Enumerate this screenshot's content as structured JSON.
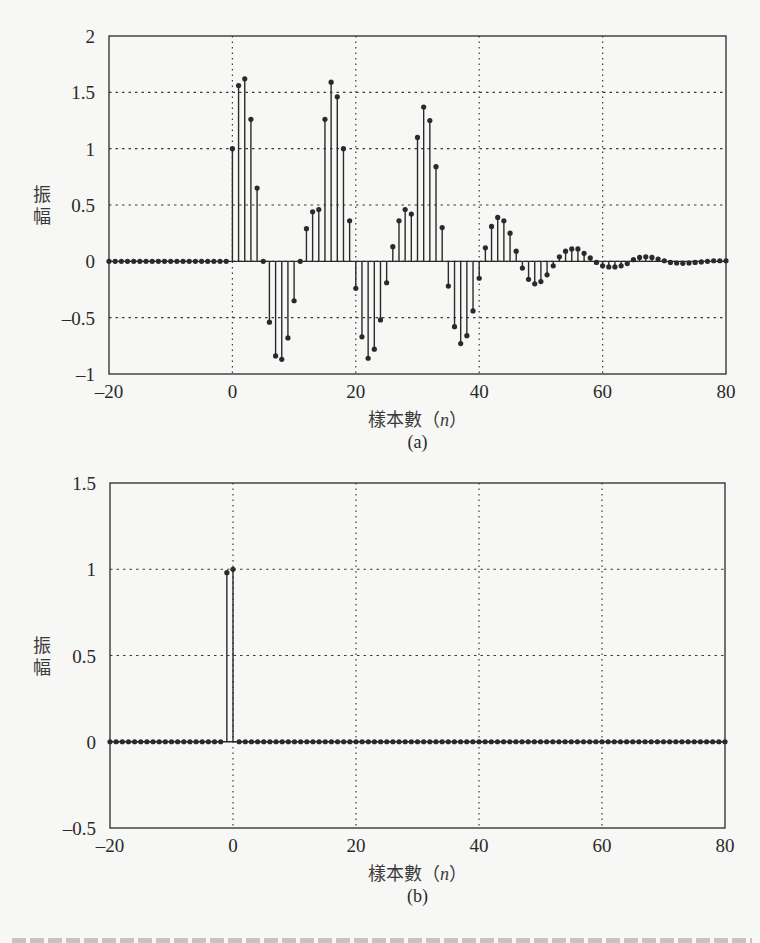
{
  "chart_data": [
    {
      "id": "a",
      "type": "stem",
      "subplot_label": "(a)",
      "xlabel": "樣本數（n）",
      "xlabel_prefix": "樣本數（",
      "xlabel_var": "n",
      "xlabel_suffix": "）",
      "ylabel": "振幅",
      "xlim": [
        -20,
        80
      ],
      "ylim": [
        -1,
        2
      ],
      "xticks": [
        -20,
        0,
        20,
        40,
        60,
        80
      ],
      "xtick_labels": [
        "–20",
        "0",
        "20",
        "40",
        "60",
        "80"
      ],
      "yticks": [
        -1,
        -0.5,
        0,
        0.5,
        1,
        1.5,
        2
      ],
      "ytick_labels": [
        "–1",
        "–0.5",
        "0",
        "0.5",
        "1",
        "1.5",
        "2"
      ],
      "grid": true,
      "frame": {
        "left": 109,
        "top": 36,
        "right": 726,
        "bottom": 374
      },
      "x_start": -20,
      "values": [
        0,
        0,
        0,
        0,
        0,
        0,
        0,
        0,
        0,
        0,
        0,
        0,
        0,
        0,
        0,
        0,
        0,
        0,
        0,
        0,
        1.0,
        1.56,
        1.62,
        1.26,
        0.65,
        0.0,
        -0.54,
        -0.84,
        -0.87,
        -0.68,
        -0.35,
        0.0,
        0.29,
        0.44,
        0.46,
        1.26,
        1.59,
        1.46,
        1.0,
        0.36,
        -0.24,
        -0.67,
        -0.86,
        -0.78,
        -0.52,
        -0.19,
        0.13,
        0.36,
        0.46,
        0.42,
        1.1,
        1.37,
        1.25,
        0.84,
        0.3,
        -0.22,
        -0.58,
        -0.73,
        -0.66,
        -0.44,
        -0.15,
        0.12,
        0.31,
        0.39,
        0.36,
        0.25,
        0.09,
        -0.06,
        -0.16,
        -0.2,
        -0.18,
        -0.12,
        -0.04,
        0.04,
        0.09,
        0.11,
        0.11,
        0.07,
        0.03,
        -0.01,
        -0.04,
        -0.05,
        -0.05,
        -0.04,
        -0.02,
        0.015,
        0.035,
        0.04,
        0.035,
        0.02,
        0.005,
        -0.01,
        -0.015,
        -0.018,
        -0.015,
        -0.01,
        -0.005,
        0.0,
        0.005,
        0.005,
        0.005
      ]
    },
    {
      "id": "b",
      "type": "stem",
      "subplot_label": "(b)",
      "xlabel": "樣本數（n）",
      "xlabel_prefix": "樣本數（",
      "xlabel_var": "n",
      "xlabel_suffix": "）",
      "ylabel": "振幅",
      "xlim": [
        -20,
        80
      ],
      "ylim": [
        -0.5,
        1.5
      ],
      "xticks": [
        -20,
        0,
        20,
        40,
        60,
        80
      ],
      "xtick_labels": [
        "–20",
        "0",
        "20",
        "40",
        "60",
        "80"
      ],
      "yticks": [
        -0.5,
        0,
        0.5,
        1,
        1.5
      ],
      "ytick_labels": [
        "–0.5",
        "0",
        "0.5",
        "1",
        "1.5"
      ],
      "grid": true,
      "frame": {
        "left": 110,
        "top": 483,
        "right": 725,
        "bottom": 828
      },
      "x_start": -20,
      "values": [
        0,
        0,
        0,
        0,
        0,
        0,
        0,
        0,
        0,
        0,
        0,
        0,
        0,
        0,
        0,
        0,
        0,
        0,
        0,
        0.98,
        1.0,
        0,
        0,
        0,
        0,
        0,
        0,
        0,
        0,
        0,
        0,
        0,
        0,
        0,
        0,
        0,
        0,
        0,
        0,
        0,
        0,
        0,
        0,
        0,
        0,
        0,
        0,
        0,
        0,
        0,
        0,
        0,
        0,
        0,
        0,
        0,
        0,
        0,
        0,
        0,
        0,
        0,
        0,
        0,
        0,
        0,
        0,
        0,
        0,
        0,
        0,
        0,
        0,
        0,
        0,
        0,
        0,
        0,
        0,
        0,
        0,
        0,
        0,
        0,
        0,
        0,
        0,
        0,
        0,
        0,
        0,
        0,
        0,
        0,
        0,
        0,
        0,
        0,
        0,
        0,
        0
      ]
    }
  ],
  "colors": {
    "ink": "#2a2a2a",
    "grid": "#3a3a3a",
    "background": "#f7f7f5"
  }
}
